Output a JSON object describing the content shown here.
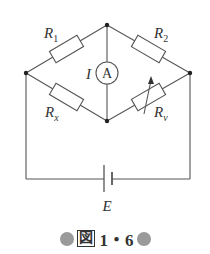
{
  "diagram": {
    "type": "wheatstone-bridge-circuit",
    "nodes": {
      "top": [
        107,
        25
      ],
      "left": [
        26,
        73
      ],
      "right": [
        190,
        73
      ],
      "bottom": [
        107,
        121
      ]
    },
    "components": [
      {
        "id": "R1",
        "label_main": "R",
        "label_sub": "1",
        "kind": "resistor",
        "between": [
          "left",
          "top"
        ]
      },
      {
        "id": "R2",
        "label_main": "R",
        "label_sub": "2",
        "kind": "resistor",
        "between": [
          "top",
          "right"
        ]
      },
      {
        "id": "Rx",
        "label_main": "R",
        "label_sub": "x",
        "kind": "resistor",
        "between": [
          "left",
          "bottom"
        ]
      },
      {
        "id": "Rv",
        "label_main": "R",
        "label_sub": "v",
        "kind": "variable-resistor",
        "between": [
          "bottom",
          "right"
        ]
      },
      {
        "id": "A",
        "label": "A",
        "kind": "ammeter",
        "between": [
          "top",
          "bottom"
        ],
        "current_label": "I"
      },
      {
        "id": "E",
        "label": "E",
        "kind": "battery",
        "between": [
          "left",
          "right"
        ]
      }
    ],
    "labels": {
      "r1_main": "R",
      "r1_sub": "1",
      "r2_main": "R",
      "r2_sub": "2",
      "rx_main": "R",
      "rx_sub": "x",
      "rv_main": "R",
      "rv_sub": "v",
      "ammeter": "A",
      "current": "I",
      "emf": "E"
    },
    "caption": {
      "kanji": "図",
      "number": "1・6"
    },
    "colors": {
      "wire": "#555555",
      "caption_dot": "#9a9a9a",
      "text": "#333333"
    }
  }
}
